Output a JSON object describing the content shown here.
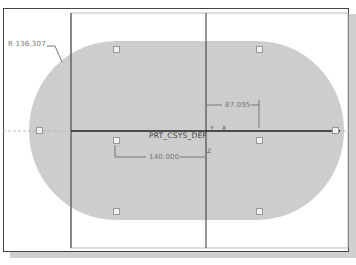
{
  "sketch": {
    "radius_dimension": "R 136.307",
    "horizontal_dimension": "87.095",
    "width_dimension": "140.000",
    "csys_label": "PRT_CSYS_DEF",
    "axis_x_label": "X",
    "axis_y_label": "Y",
    "axis_z_label": "Z"
  },
  "colors": {
    "fill": "#cdcdcd",
    "lines": "#333333",
    "dimension_text": "#777777"
  }
}
